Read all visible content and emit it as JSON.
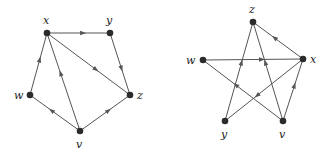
{
  "graphs": [
    {
      "id": "left",
      "nodes": [
        {
          "id": "x",
          "label": "x",
          "cx": 47,
          "cy": 33,
          "lx": 43,
          "ly": 24
        },
        {
          "id": "y",
          "label": "y",
          "cx": 110,
          "cy": 33,
          "lx": 106,
          "ly": 24
        },
        {
          "id": "z",
          "label": "z",
          "cx": 130,
          "cy": 95,
          "lx": 137,
          "ly": 99
        },
        {
          "id": "w",
          "label": "w",
          "cx": 30,
          "cy": 95,
          "lx": 14,
          "ly": 99
        },
        {
          "id": "v",
          "label": "v",
          "cx": 80,
          "cy": 131,
          "lx": 76,
          "ly": 148
        }
      ],
      "edges": [
        {
          "from": "x",
          "to": "y"
        },
        {
          "from": "y",
          "to": "z"
        },
        {
          "from": "x",
          "to": "z"
        },
        {
          "from": "w",
          "to": "x"
        },
        {
          "from": "v",
          "to": "x"
        },
        {
          "from": "v",
          "to": "w"
        },
        {
          "from": "v",
          "to": "z"
        }
      ]
    },
    {
      "id": "right",
      "nodes": [
        {
          "id": "z",
          "label": "z",
          "cx": 253,
          "cy": 22,
          "lx": 249,
          "ly": 13
        },
        {
          "id": "w",
          "label": "w",
          "cx": 203,
          "cy": 60,
          "lx": 186,
          "ly": 64
        },
        {
          "id": "x",
          "label": "x",
          "cx": 303,
          "cy": 59,
          "lx": 310,
          "ly": 63
        },
        {
          "id": "y",
          "label": "y",
          "cx": 225,
          "cy": 121,
          "lx": 221,
          "ly": 138
        },
        {
          "id": "v",
          "label": "v",
          "cx": 283,
          "cy": 121,
          "lx": 279,
          "ly": 138
        }
      ],
      "edges": [
        {
          "from": "x",
          "to": "z"
        },
        {
          "from": "w",
          "to": "x"
        },
        {
          "from": "y",
          "to": "z"
        },
        {
          "from": "v",
          "to": "z"
        },
        {
          "from": "v",
          "to": "w"
        },
        {
          "from": "v",
          "to": "x"
        },
        {
          "from": "x",
          "to": "y"
        }
      ]
    }
  ],
  "colors": {
    "edge": "#555555",
    "node": "#2b2b2b",
    "label": "#222222"
  }
}
